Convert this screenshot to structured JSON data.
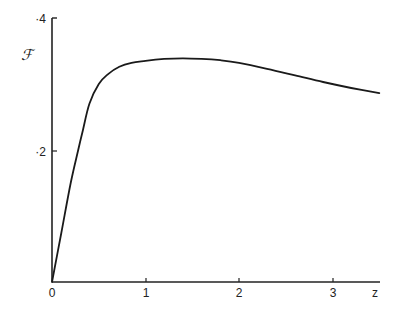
{
  "chart_data": {
    "type": "line",
    "title": "",
    "xlabel": "z",
    "ylabel": "ℱ",
    "xlim": [
      0,
      3.5
    ],
    "ylim": [
      0,
      0.4
    ],
    "grid": false,
    "legend": null,
    "x_ticks": [
      0,
      1,
      2,
      3
    ],
    "x_tick_labels": [
      "0",
      "1",
      "2",
      "3"
    ],
    "y_ticks": [
      0.2,
      0.4
    ],
    "y_tick_labels": [
      "·2",
      "·4"
    ],
    "series": [
      {
        "name": "F(z)",
        "x": [
          0,
          0.1,
          0.2,
          0.28,
          0.33,
          0.4,
          0.5,
          0.6,
          0.72,
          0.85,
          1.0,
          1.2,
          1.4,
          1.6,
          1.8,
          2.0,
          2.3,
          2.6,
          2.9,
          3.2,
          3.5
        ],
        "values": [
          0,
          0.075,
          0.15,
          0.2,
          0.23,
          0.27,
          0.3,
          0.315,
          0.326,
          0.332,
          0.335,
          0.338,
          0.339,
          0.338,
          0.336,
          0.332,
          0.323,
          0.313,
          0.303,
          0.294,
          0.286
        ]
      }
    ]
  },
  "labels": {
    "y_axis": "ℱ",
    "x_axis": "z",
    "x_tick_0": "0",
    "x_tick_1": "1",
    "x_tick_2": "2",
    "x_tick_3": "3",
    "y_tick_02": "·2",
    "y_tick_04": "·4"
  }
}
